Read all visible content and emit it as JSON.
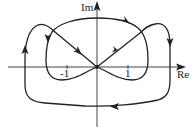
{
  "diagram": {
    "type": "nyquist-contour",
    "axes": {
      "x_label": "Re",
      "y_label": "Im",
      "ticks": [
        {
          "value": -1,
          "label": "-1"
        },
        {
          "value": 1,
          "label": "1"
        }
      ]
    },
    "colors": {
      "line": "#222222",
      "background": "#ffffff"
    }
  }
}
